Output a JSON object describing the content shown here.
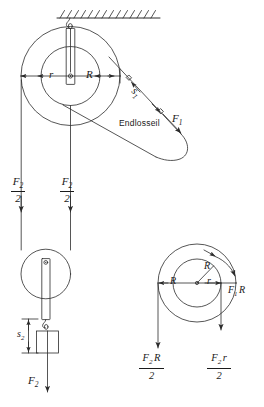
{
  "figure": {
    "language": "de",
    "line_color": "#2b2b2b",
    "text_color": "#1a1a1a",
    "background": "#ffffff"
  },
  "labels": {
    "inner_radius": "r",
    "outer_radius": "R",
    "outer_radius_right": "R",
    "rope_name": "Endlosseil",
    "displacement_1": "s",
    "displacement_1_sub": "1",
    "displacement_2": "s",
    "displacement_2_sub": "2",
    "force_1": "F",
    "force_1_sub": "1",
    "force_2": "F",
    "force_2_sub": "2"
  },
  "fractions": {
    "half_f2_left": {
      "numerator": "F",
      "numerator_sub": "2",
      "denominator": "2"
    },
    "half_f2_right": {
      "numerator": "F",
      "numerator_sub": "2",
      "denominator": "2"
    },
    "torque_f2R": {
      "numerator": "F",
      "numerator_sub": "2",
      "numerator_tail": "R",
      "denominator": "2"
    },
    "torque_f2r": {
      "numerator": "F",
      "numerator_sub": "2",
      "numerator_tail": "r",
      "denominator": "2"
    }
  },
  "right_diagram": {
    "torque_f1R": "F",
    "torque_f1R_sub": "1",
    "torque_f1R_tail": "R",
    "radius_left": "R",
    "radius_inner": "r",
    "radius_upper": "R"
  },
  "components": {
    "ceiling_label": "hatched-ceiling",
    "upper_pulley": "stepped-pulley",
    "lower_pulley": "movable-pulley",
    "load_block": "load-weight",
    "hook": "ceiling-hook"
  }
}
